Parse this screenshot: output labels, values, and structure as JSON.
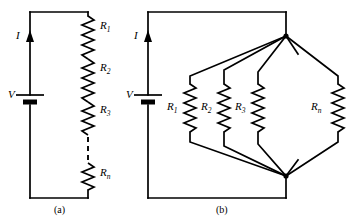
{
  "figure": {
    "background_color": "#ffffff",
    "line_color": "#000000",
    "panels": [
      {
        "id": "a",
        "caption": "(a)",
        "type": "series-resistor-circuit",
        "source_label": "V",
        "current_label": "I",
        "resistor_labels": [
          "R",
          "R",
          "R",
          "R"
        ],
        "resistor_subscripts": [
          "1",
          "2",
          "3",
          "n"
        ],
        "has_dashed_continuation": true
      },
      {
        "id": "b",
        "caption": "(b)",
        "type": "parallel-resistor-circuit",
        "source_label": "V",
        "current_label": "I",
        "resistor_labels": [
          "R",
          "R",
          "R",
          "R"
        ],
        "resistor_subscripts": [
          "1",
          "2",
          "3",
          "n"
        ],
        "has_dashed_continuation": true
      }
    ]
  },
  "panel_a": {
    "caption": "(a)",
    "current_label": "I",
    "source_label": "V",
    "resistors": [
      {
        "label": "R",
        "sub": "1"
      },
      {
        "label": "R",
        "sub": "2"
      },
      {
        "label": "R",
        "sub": "3"
      },
      {
        "label": "R",
        "sub": "n"
      }
    ]
  },
  "panel_b": {
    "caption": "(b)",
    "current_label": "I",
    "source_label": "V",
    "resistors": [
      {
        "label": "R",
        "sub": "1"
      },
      {
        "label": "R",
        "sub": "2"
      },
      {
        "label": "R",
        "sub": "3"
      },
      {
        "label": "R",
        "sub": "n"
      }
    ]
  }
}
